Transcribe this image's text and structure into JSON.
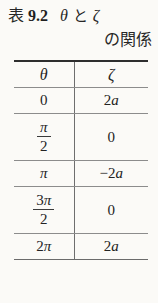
{
  "caption": {
    "label": "表",
    "number": "9.2",
    "symbol_1": "θ",
    "conjunction": "と",
    "symbol_2": "ζ",
    "line2": "の関係",
    "full_text": "表 9.2  θ と ζ の関係"
  },
  "table": {
    "headers": [
      "θ",
      "ζ"
    ],
    "rows": [
      {
        "theta": "0",
        "theta_num": "",
        "theta_sym": "0",
        "theta_den": "",
        "is_fraction": false,
        "zeta": "2a",
        "zeta_sign": "",
        "zeta_coef": "2",
        "zeta_var": "a"
      },
      {
        "theta": "π/2",
        "theta_num": "",
        "theta_sym": "π",
        "theta_den": "2",
        "is_fraction": true,
        "zeta": "0",
        "zeta_sign": "",
        "zeta_coef": "0",
        "zeta_var": ""
      },
      {
        "theta": "π",
        "theta_num": "",
        "theta_sym": "π",
        "theta_den": "",
        "is_fraction": false,
        "zeta": "−2a",
        "zeta_sign": "−",
        "zeta_coef": "2",
        "zeta_var": "a"
      },
      {
        "theta": "3π/2",
        "theta_num": "3",
        "theta_sym": "π",
        "theta_den": "2",
        "is_fraction": true,
        "zeta": "0",
        "zeta_sign": "",
        "zeta_coef": "0",
        "zeta_var": ""
      },
      {
        "theta": "2π",
        "theta_num": "2",
        "theta_sym": "π",
        "theta_den": "",
        "is_fraction": false,
        "zeta": "2a",
        "zeta_sign": "",
        "zeta_coef": "2",
        "zeta_var": "a"
      }
    ]
  },
  "cells": {
    "r0": {
      "theta": "0",
      "zeta_coef": "2",
      "zeta_var": "a"
    },
    "r1": {
      "theta_num": "π",
      "theta_den": "2",
      "zeta": "0"
    },
    "r2": {
      "theta": "π",
      "zeta_sign": "−",
      "zeta_coef": "2",
      "zeta_var": "a"
    },
    "r3": {
      "theta_coef": "3",
      "theta_pi": "π",
      "theta_den": "2",
      "zeta": "0"
    },
    "r4": {
      "theta_coef": "2",
      "theta_pi": "π",
      "zeta_coef": "2",
      "zeta_var": "a"
    }
  },
  "colors": {
    "page_background": "#fbfaf7",
    "text": "#232323",
    "rule_heavy": "#2e2e2e",
    "rule_light": "#8c8c8c"
  }
}
